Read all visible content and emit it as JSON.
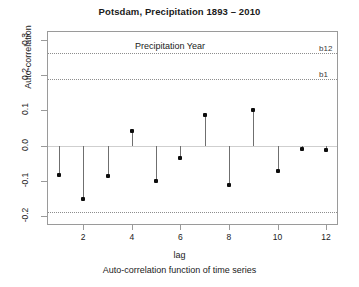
{
  "chart_data": {
    "type": "bar",
    "title": "Potsdam, Precipitation 1893 – 2010",
    "xlabel": "lag",
    "ylabel": "Auto-correlation",
    "subtitle": "Auto-correlation function of time series",
    "annotation": "Precipitation Year",
    "categories": [
      1,
      2,
      3,
      4,
      5,
      6,
      7,
      8,
      9,
      10,
      11,
      12
    ],
    "values": [
      -0.082,
      -0.152,
      -0.085,
      0.042,
      -0.1,
      -0.034,
      0.087,
      -0.113,
      0.102,
      -0.072,
      -0.009,
      -0.012
    ],
    "xtick_labels": [
      "2",
      "4",
      "6",
      "8",
      "10",
      "12"
    ],
    "xtick_values": [
      2,
      4,
      6,
      8,
      10,
      12
    ],
    "ytick_labels": [
      "0.3",
      "0.2",
      "0.1",
      "0.0",
      "-0.1",
      "-0.2"
    ],
    "ytick_values": [
      0.3,
      0.2,
      0.1,
      0.0,
      -0.1,
      -0.2
    ],
    "ylim": [
      -0.225,
      0.325
    ],
    "xlim": [
      0.55,
      12.45
    ],
    "grid": false,
    "legend": "none",
    "reference_lines": [
      {
        "name": "b12",
        "label": "b12",
        "value": 0.263,
        "style": "dotted"
      },
      {
        "name": "b1",
        "label": "b1",
        "value": 0.188,
        "style": "dotted"
      },
      {
        "name": "b1-lower",
        "label": "",
        "value": -0.188,
        "style": "dotted"
      }
    ],
    "zero_line": 0.0,
    "colors": {
      "point": "#0d0d0d",
      "stem": "#6f6f6f",
      "zero_line": "#cfcfcf",
      "conf_line": "#8d8d8d",
      "frame": "#9a9a9a",
      "background": "#ffffff",
      "text": "#1a1a1a"
    }
  }
}
